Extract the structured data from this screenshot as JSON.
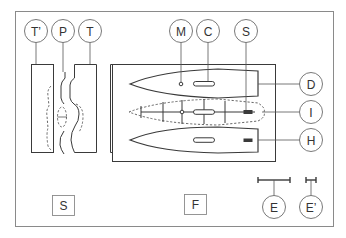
{
  "figure": {
    "panels": [
      {
        "id": "S",
        "label": "S"
      },
      {
        "id": "F",
        "label": "F"
      }
    ],
    "callouts": {
      "t_prime": "T’",
      "p": "P",
      "t": "T",
      "m": "M",
      "c": "C",
      "s": "S",
      "d": "D",
      "i": "I",
      "h": "H",
      "e": "E",
      "e_prime": "E’"
    },
    "panel_labels": {
      "side_view": "S",
      "front_view": "F"
    },
    "colors": {
      "line": "#3a3a3a",
      "frame": "#8a8a8a",
      "background": "#ffffff"
    }
  }
}
